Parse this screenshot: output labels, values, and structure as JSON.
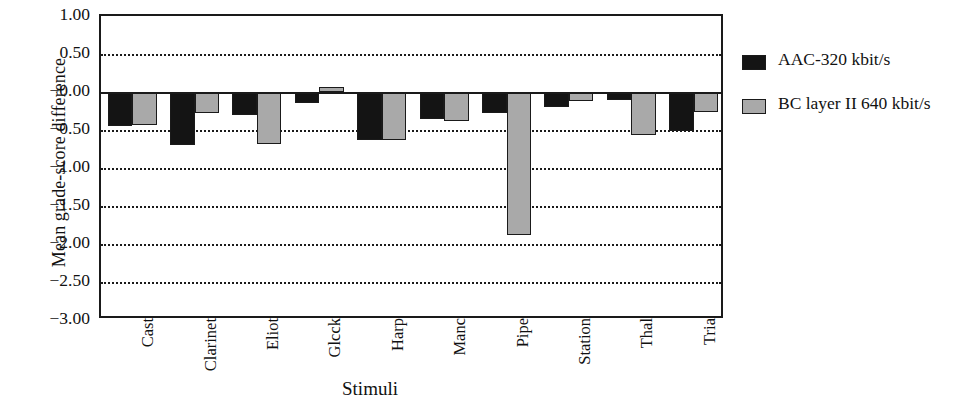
{
  "chart_data": {
    "type": "bar",
    "title": "",
    "xlabel": "Stimuli",
    "ylabel": "Mean grade-score difference",
    "ylim": [
      -3.0,
      1.0
    ],
    "ytick_step": 0.5,
    "ytick_labels": [
      "1.00",
      "0.50",
      "-0.00",
      "-0.50",
      "-1.00",
      "-1.50",
      "-2.00",
      "-2.50",
      "-3.00"
    ],
    "ytick_values": [
      1.0,
      0.5,
      0.0,
      -0.5,
      -1.0,
      -1.5,
      -2.0,
      -2.5,
      -3.0
    ],
    "grid": true,
    "grid_style": "dotted-horizontal",
    "zero_line": true,
    "legend_position": "right",
    "categories": [
      "Cast",
      "Clarinet",
      "Eliot",
      "Glcck",
      "Harp",
      "Manc",
      "Pipe",
      "Station",
      "Thal",
      "Tria"
    ],
    "series": [
      {
        "name": "AAC-320 kbit/s",
        "color": "#141414",
        "values": [
          -0.45,
          -0.7,
          -0.3,
          -0.15,
          -0.63,
          -0.35,
          -0.28,
          -0.2,
          -0.1,
          -0.51
        ]
      },
      {
        "name": "BC layer II  640 kbit/s",
        "color": "#a9a9a9",
        "values": [
          -0.44,
          -0.27,
          -0.68,
          0.07,
          -0.63,
          -0.38,
          -1.88,
          -0.12,
          -0.56,
          -0.26
        ]
      }
    ]
  },
  "legend": {
    "entries": [
      {
        "label": "AAC-320 kbit/s",
        "swatch": "dark"
      },
      {
        "label": "BC layer II  640 kbit/s",
        "swatch": "light"
      }
    ]
  }
}
